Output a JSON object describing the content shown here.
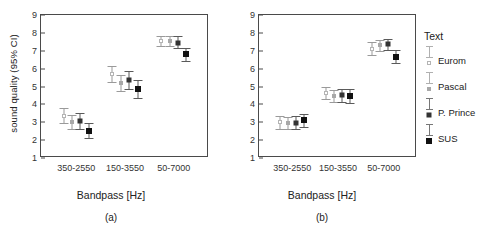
{
  "figure": {
    "panels": [
      {
        "id": "a",
        "letter": "(a)"
      },
      {
        "id": "b",
        "letter": "(b)"
      }
    ]
  },
  "legend": {
    "title": "Text",
    "entries": [
      {
        "label": "Eurom",
        "marker": "open"
      },
      {
        "label": "Pascal",
        "marker": "gray"
      },
      {
        "label": "P. Prince",
        "marker": "dark"
      },
      {
        "label": "SUS",
        "marker": "black"
      }
    ]
  },
  "chart_data": [
    {
      "type": "scatter",
      "panel": "(a)",
      "title": "",
      "xlabel": "Bandpass [Hz]",
      "ylabel": "sound quality (95% CI)",
      "categories": [
        "350-2550",
        "150-3550",
        "50-7000"
      ],
      "yticks": [
        1,
        2,
        3,
        4,
        5,
        6,
        7,
        8,
        9
      ],
      "ylim": [
        1,
        9
      ],
      "grid": false,
      "legend_position": "right",
      "series": [
        {
          "name": "Eurom",
          "marker": "open",
          "values": [
            3.35,
            5.7,
            7.55
          ],
          "ci_low": [
            2.95,
            5.25,
            7.25
          ],
          "ci_high": [
            3.8,
            6.15,
            7.85
          ]
        },
        {
          "name": "Pascal",
          "marker": "gray",
          "values": [
            3.0,
            5.2,
            7.55
          ],
          "ci_low": [
            2.6,
            4.75,
            7.25
          ],
          "ci_high": [
            3.4,
            5.65,
            7.85
          ]
        },
        {
          "name": "P. Prince",
          "marker": "dark",
          "values": [
            3.05,
            5.35,
            7.45
          ],
          "ci_low": [
            2.65,
            4.85,
            7.15
          ],
          "ci_high": [
            3.5,
            5.85,
            7.8
          ]
        },
        {
          "name": "SUS",
          "marker": "black",
          "values": [
            2.5,
            4.85,
            6.8
          ],
          "ci_low": [
            2.1,
            4.35,
            6.4
          ],
          "ci_high": [
            2.95,
            5.35,
            7.15
          ]
        }
      ]
    },
    {
      "type": "scatter",
      "panel": "(b)",
      "title": "",
      "xlabel": "Bandpass [Hz]",
      "ylabel": "",
      "categories": [
        "350-2550",
        "150-3550",
        "50-7000"
      ],
      "yticks": [
        1,
        2,
        3,
        4,
        5,
        6,
        7,
        8,
        9
      ],
      "ylim": [
        1,
        9
      ],
      "grid": false,
      "legend_position": "right",
      "series": [
        {
          "name": "Eurom",
          "marker": "open",
          "values": [
            3.0,
            4.65,
            7.1
          ],
          "ci_low": [
            2.6,
            4.3,
            6.75
          ],
          "ci_high": [
            3.35,
            5.0,
            7.5
          ]
        },
        {
          "name": "Pascal",
          "marker": "gray",
          "values": [
            2.95,
            4.45,
            7.3
          ],
          "ci_low": [
            2.6,
            4.15,
            7.0
          ],
          "ci_high": [
            3.3,
            4.8,
            7.6
          ]
        },
        {
          "name": "P. Prince",
          "marker": "dark",
          "values": [
            2.95,
            4.5,
            7.4
          ],
          "ci_low": [
            2.6,
            4.15,
            7.05
          ],
          "ci_high": [
            3.35,
            4.85,
            7.65
          ]
        },
        {
          "name": "SUS",
          "marker": "black",
          "values": [
            3.1,
            4.45,
            6.65
          ],
          "ci_low": [
            2.75,
            4.1,
            6.3
          ],
          "ci_high": [
            3.45,
            4.85,
            7.05
          ]
        }
      ]
    }
  ]
}
